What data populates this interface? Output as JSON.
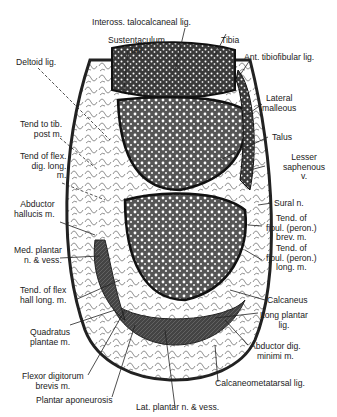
{
  "figure": {
    "labels": {
      "inteross": "Inteross. talocalcaneal lig.",
      "sustentaculum": "Sustentaculum\ntali",
      "tibia": "Tibia",
      "ant_tibiofibular": "Ant. tibiofibular lig.",
      "deltoid": "Deltoid lig.",
      "lateral_malleolus": "Lateral\nmalleous",
      "tend_tib_post": "Tend to tib.\npost m.",
      "talus": "Talus",
      "tend_flex_dig": "Tend of flex.\ndig. long.\nm.",
      "lesser_saphenous": "Lesser\nsaphenous\nv.",
      "abductor_hallucis": "Abductor\nhallucis m.",
      "sural": "Sural n.",
      "med_plantar": "Med. plantar\nn. & vess.",
      "tend_fibul_brev": "Tend. of\nfibul. (peron.)\nbrev. m.",
      "tend_fibul_long": "Tend. of\nfibul. (peron.)\nlong. m.",
      "tend_flex_hall": "Tend. of flex\nhall long. m.",
      "calcaneus": "Calcaneus",
      "long_plantar": "Long plantar\nlig.",
      "quadratus": "Quadratus\nplantae m.",
      "abductor_dig_min": "Abductor dig.\nminimi m.",
      "flexor_dig_brev": "Flexor digitorum\nbrevis m.",
      "calcaneometatarsal": "Calcaneometatarsal lig.",
      "plantar_aponeurosis": "Plantar aponeurosis",
      "lat_plantar": "Lat. plantar n. & vess."
    }
  }
}
